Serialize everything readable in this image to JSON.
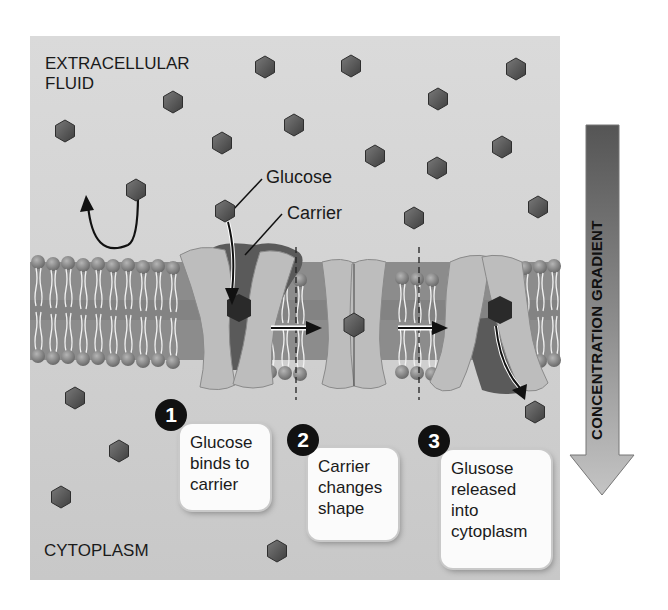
{
  "regions": {
    "top_label_line1": "EXTRACELLULAR",
    "top_label_line2": "FLUID",
    "bottom_label": "CYTOPLASM"
  },
  "callouts": {
    "glucose": "Glucose",
    "carrier": "Carrier"
  },
  "gradient": {
    "label": "CONCENTRATION GRADIENT",
    "colors": {
      "top": "#5a5a5a",
      "bottom": "#bdbdbd"
    }
  },
  "steps": [
    {
      "number": "1",
      "lines": [
        "Glucose",
        "binds to",
        "carrier"
      ]
    },
    {
      "number": "2",
      "lines": [
        "Carrier",
        "changes",
        "shape"
      ]
    },
    {
      "number": "3",
      "lines": [
        "Glusose",
        "released",
        "into",
        "cytoplasm"
      ]
    }
  ],
  "colors": {
    "background": "#d4d4d4",
    "glucose": "#555555",
    "carrier": "#bdbdbd",
    "lipid_head": "#8a8a8a",
    "badge": "#111111"
  }
}
